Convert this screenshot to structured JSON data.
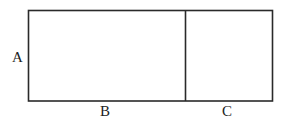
{
  "diagram": {
    "labels": {
      "height": "A",
      "left_width": "B",
      "right_width": "C"
    },
    "colors": {
      "line": "#2a2a2a",
      "text": "#222222",
      "background": "#ffffff"
    }
  }
}
